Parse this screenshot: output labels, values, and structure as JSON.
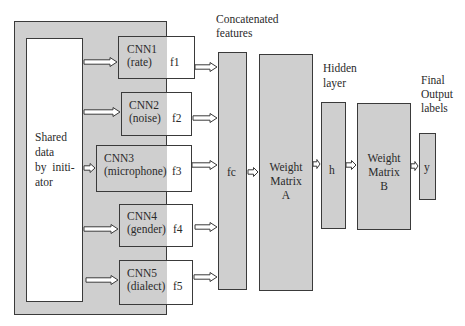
{
  "diagram": {
    "source": {
      "label_lines": [
        "Shared",
        "data",
        "by  initi-",
        "ator"
      ]
    },
    "cnns": [
      {
        "name": "CNN1",
        "attribute": "(rate)",
        "feature": "f1"
      },
      {
        "name": "CNN2",
        "attribute": "(noise)",
        "feature": "f2"
      },
      {
        "name": "CNN3",
        "attribute": "(microphone)",
        "feature": "f3"
      },
      {
        "name": "CNN4",
        "attribute": "(gender)",
        "feature": "f4"
      },
      {
        "name": "CNN5",
        "attribute": "(dialect)",
        "feature": "f5"
      }
    ],
    "concat": {
      "caption_lines": [
        "Concatenated",
        "features"
      ],
      "label": "fc"
    },
    "weight_a": {
      "label_lines": [
        "Weight",
        "Matrix",
        "A"
      ]
    },
    "hidden": {
      "caption_lines": [
        "Hidden",
        "layer"
      ],
      "label": "h"
    },
    "weight_b": {
      "label_lines": [
        "Weight",
        "Matrix",
        "B"
      ]
    },
    "output": {
      "caption_lines": [
        "Final",
        "Output",
        "labels"
      ],
      "label": "y"
    },
    "colors": {
      "box_fill": "#cfcfcf",
      "box_border": "#3a3a3a",
      "background": "#ffffff"
    }
  }
}
